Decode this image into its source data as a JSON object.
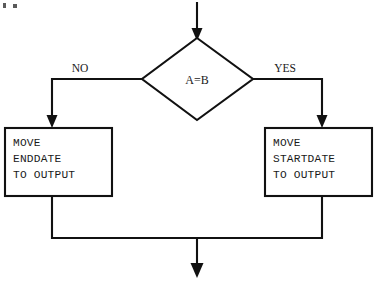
{
  "diagram": {
    "background_color": "#ffffff",
    "line_color": "#111111",
    "text_color": "#1a1a1a"
  },
  "decision": {
    "label": "A=B",
    "shape": "diamond"
  },
  "branches": {
    "left_label": "NO",
    "right_label": "YES"
  },
  "process_left": {
    "line1": "MOVE",
    "line2": "ENDDATE",
    "line3": "TO OUTPUT"
  },
  "process_right": {
    "line1": "MOVE",
    "line2": "STARTDATE",
    "line3": "TO OUTPUT"
  },
  "connectors": {
    "entry_arrow": "down-arrow-into-decision",
    "left_branch": "decision-left-to-endate-box",
    "right_branch": "decision-right-to-startdate-box",
    "merge_line": "both-boxes-merge",
    "exit_arrow": "down-arrow-out"
  }
}
